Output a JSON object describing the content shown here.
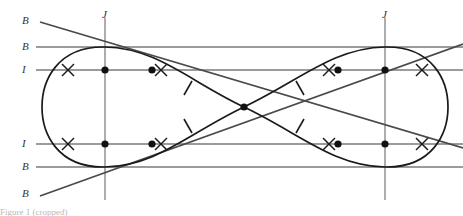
{
  "figure": {
    "type": "geometric-diagram",
    "width": 463,
    "height": 216,
    "background": "#ffffff",
    "colors": {
      "curve": "#1a1a1a",
      "guide_line": "#7a7a7a",
      "diagonal_line": "#4a4a4a",
      "axis_line": "#8a8a8a",
      "point": "#111111",
      "label_text": "#333333",
      "caption_text": "#b9b9b9"
    }
  },
  "labels": {
    "left_axis": [
      {
        "text": "B",
        "y": 21
      },
      {
        "text": "B",
        "y": 47
      },
      {
        "text": "I",
        "y": 70
      },
      {
        "text": "I",
        "y": 144
      },
      {
        "text": "B",
        "y": 167
      },
      {
        "text": "B",
        "y": 194
      }
    ],
    "top_axis": [
      {
        "text": "J",
        "x": 105
      },
      {
        "text": "J",
        "x": 385
      }
    ]
  },
  "caption": {
    "text": "Figure 1 (cropped)"
  },
  "geometry": {
    "horizontal_lines_y": [
      47,
      70,
      144,
      167
    ],
    "vertical_lines_x": [
      105,
      385
    ],
    "center": {
      "x": 244,
      "y": 107
    },
    "points": [
      {
        "x": 105,
        "y": 70
      },
      {
        "x": 152,
        "y": 70
      },
      {
        "x": 338,
        "y": 70
      },
      {
        "x": 385,
        "y": 70
      },
      {
        "x": 105,
        "y": 144
      },
      {
        "x": 152,
        "y": 144
      },
      {
        "x": 338,
        "y": 144
      },
      {
        "x": 385,
        "y": 144
      },
      {
        "x": 244,
        "y": 107
      }
    ],
    "cross_marks": [
      {
        "x": 68,
        "y": 70
      },
      {
        "x": 161,
        "y": 70
      },
      {
        "x": 329,
        "y": 70
      },
      {
        "x": 422,
        "y": 70
      },
      {
        "x": 68,
        "y": 144
      },
      {
        "x": 161,
        "y": 144
      },
      {
        "x": 329,
        "y": 144
      },
      {
        "x": 422,
        "y": 144
      }
    ],
    "tick_marks": [
      {
        "x": 188,
        "y": 88
      },
      {
        "x": 300,
        "y": 88
      },
      {
        "x": 188,
        "y": 126
      },
      {
        "x": 300,
        "y": 126
      }
    ]
  }
}
